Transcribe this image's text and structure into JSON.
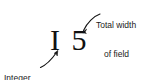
{
  "figure": {
    "background_color": "#ffffff",
    "ink_color": "#111111"
  },
  "sample": {
    "text": "I 5",
    "descriptor_letter": "I",
    "width_digits": "5"
  },
  "callouts": [
    {
      "id": "total-width",
      "line_1": "Total width",
      "line_2": "of field",
      "points_to": "width-digits",
      "arrow": "curved-down-left"
    },
    {
      "id": "integer-number",
      "line_1": "Integer",
      "line_2": "number",
      "points_to": "descriptor-letter",
      "arrow": "curved-up-right"
    }
  ]
}
